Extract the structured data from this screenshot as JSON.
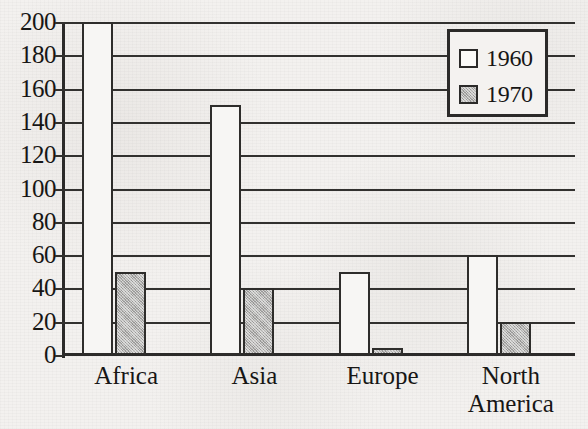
{
  "chart_data": {
    "type": "bar",
    "title": "",
    "subtitle": "",
    "xlabel": "",
    "ylabel": "",
    "categories": [
      "Africa",
      "Asia",
      "Europe",
      "North America"
    ],
    "category_lines": [
      [
        "Africa"
      ],
      [
        "Asia"
      ],
      [
        "Europe"
      ],
      [
        "North",
        "America"
      ]
    ],
    "series": [
      {
        "name": "1960",
        "values": [
          200,
          150,
          50,
          60
        ],
        "fill": "white",
        "color": "#f7f6f4"
      },
      {
        "name": "1970",
        "values": [
          50,
          40,
          4,
          20
        ],
        "fill": "gray-dither",
        "color": "#b4b3b1"
      }
    ],
    "ylim": [
      0,
      200
    ],
    "ytick_labels": [
      "200",
      "180",
      "160",
      "140",
      "120",
      "100",
      "80",
      "60",
      "40",
      "20",
      "0"
    ],
    "ytick_values": [
      200,
      180,
      160,
      140,
      120,
      100,
      80,
      60,
      40,
      20,
      0
    ],
    "ytick_step": 20,
    "grid": "horizontal",
    "legend_position": "top-right"
  },
  "legend": {
    "entries": [
      {
        "label": "1960",
        "swatch": "white-square"
      },
      {
        "label": "1970",
        "swatch": "gray-square"
      }
    ]
  },
  "colors": {
    "background": "#f3f1ef",
    "ink": "#2b2a29",
    "series_1960": "#f7f6f4",
    "series_1970": "#b4b3b1"
  }
}
